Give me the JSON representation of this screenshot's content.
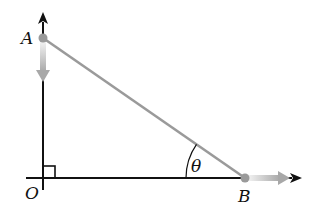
{
  "diagram": {
    "type": "sliding-ladder-geometry",
    "labels": {
      "point_a": "A",
      "point_b": "B",
      "origin": "O",
      "angle": "θ"
    },
    "colors": {
      "axis": "#111111",
      "ladder": "#9a9a9a",
      "point": "#9a9a9a",
      "velocity_arrow": "#b8b8b8"
    },
    "elements": [
      "vertical axis with up arrow",
      "horizontal axis with right arrow",
      "segment AB (ladder)",
      "right-angle marker at O",
      "angle θ at B",
      "downward velocity arrow at A",
      "rightward velocity arrow at B"
    ]
  }
}
